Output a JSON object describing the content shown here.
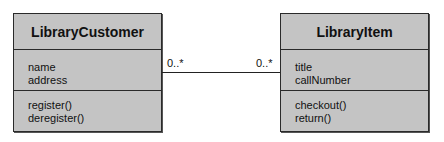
{
  "classes": [
    {
      "name": "LibraryCustomer",
      "attributes": [
        "name",
        "address"
      ],
      "operations": [
        "register()",
        "deregister()"
      ]
    },
    {
      "name": "LibraryItem",
      "attributes": [
        "title",
        "callNumber"
      ],
      "operations": [
        "checkout()",
        "return()"
      ]
    }
  ],
  "association": {
    "left_multiplicity": "0..*",
    "right_multiplicity": "0..*"
  },
  "colors": {
    "class_fill": "#c4c4c4",
    "border": "#2a2a2a",
    "background": "#ffffff"
  }
}
